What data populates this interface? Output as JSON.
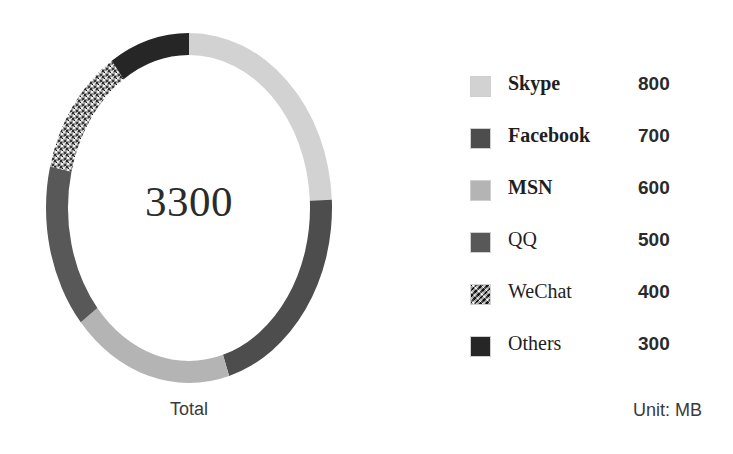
{
  "chart_data": {
    "type": "pie",
    "variant": "donut",
    "title": "",
    "center_value": "3300",
    "center_caption": "Total",
    "unit_note": "Unit: MB",
    "total": 3300,
    "start_angle_deg": 0,
    "direction": "clockwise",
    "categories": [
      "Skype",
      "Facebook",
      "MSN",
      "QQ",
      "WeChat",
      "Others"
    ],
    "values": [
      800,
      700,
      600,
      500,
      400,
      300
    ],
    "slices": [
      {
        "label": "Skype",
        "value": 800,
        "value_text": "800",
        "color": "#d2d2d2",
        "pattern": "solid",
        "percent": 24.2,
        "start_deg": 0.0,
        "sweep_deg": 87.3
      },
      {
        "label": "Facebook",
        "value": 700,
        "value_text": "700",
        "color": "#4d4d4d",
        "pattern": "solid",
        "percent": 21.2,
        "start_deg": 87.3,
        "sweep_deg": 76.4
      },
      {
        "label": "MSN",
        "value": 600,
        "value_text": "600",
        "color": "#b4b4b4",
        "pattern": "solid",
        "percent": 18.2,
        "start_deg": 163.7,
        "sweep_deg": 65.5
      },
      {
        "label": "QQ",
        "value": 500,
        "value_text": "500",
        "color": "#585858",
        "pattern": "solid",
        "percent": 15.2,
        "start_deg": 229.2,
        "sweep_deg": 54.5
      },
      {
        "label": "WeChat",
        "value": 400,
        "value_text": "400",
        "color": "#8a8a8a",
        "pattern": "speckle",
        "percent": 12.1,
        "start_deg": 283.7,
        "sweep_deg": 43.6
      },
      {
        "label": "Others",
        "value": 300,
        "value_text": "300",
        "color": "#262626",
        "pattern": "solid",
        "percent": 9.1,
        "start_deg": 327.3,
        "sweep_deg": 32.7
      }
    ],
    "legend": {
      "position": "right",
      "entries": [
        {
          "label": "Skype",
          "value_text": "800",
          "bold": true
        },
        {
          "label": "Facebook",
          "value_text": "700",
          "bold": true
        },
        {
          "label": "MSN",
          "value_text": "600",
          "bold": true
        },
        {
          "label": "QQ",
          "value_text": "500",
          "bold": false
        },
        {
          "label": "WeChat",
          "value_text": "400",
          "bold": false
        },
        {
          "label": "Others",
          "value_text": "300",
          "bold": false
        }
      ]
    }
  }
}
